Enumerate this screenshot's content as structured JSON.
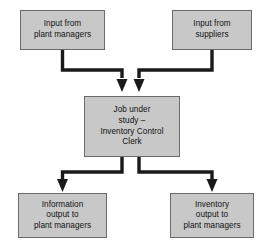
{
  "diagram": {
    "type": "flowchart",
    "colors": {
      "node_fill": "#c8c8c8",
      "node_border": "#6b6b6b",
      "connector": "#1a1a1a",
      "text": "#111111",
      "background": "#ffffff"
    },
    "nodes": [
      {
        "id": "input-plant-managers",
        "role": "input",
        "label": "Input from\nplant managers"
      },
      {
        "id": "input-suppliers",
        "role": "input",
        "label": "Input from\nsuppliers"
      },
      {
        "id": "job-under-study",
        "role": "process",
        "label": "Job under\nstudy –\nInventory Control\nClerk"
      },
      {
        "id": "information-output",
        "role": "output",
        "label": "Information\noutput to\nplant managers"
      },
      {
        "id": "inventory-output",
        "role": "output",
        "label": "Inventory\noutput to\nplant managers"
      }
    ],
    "connectors": [
      {
        "id": "plant-managers-to-job",
        "from": "input-plant-managers",
        "to": "job-under-study",
        "arrow": "end"
      },
      {
        "id": "suppliers-to-job",
        "from": "input-suppliers",
        "to": "job-under-study",
        "arrow": "end"
      },
      {
        "id": "job-to-information-output",
        "from": "job-under-study",
        "to": "information-output",
        "arrow": "end"
      },
      {
        "id": "job-to-inventory-output",
        "from": "job-under-study",
        "to": "inventory-output",
        "arrow": "end"
      }
    ]
  }
}
